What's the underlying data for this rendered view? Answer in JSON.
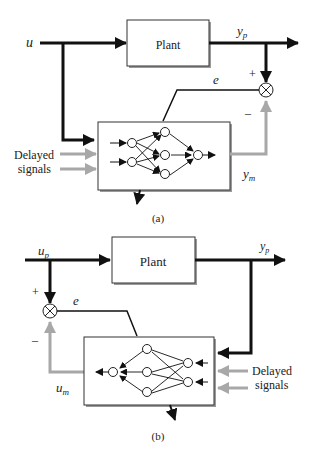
{
  "diagram_a": {
    "input_label": "u",
    "output_label": "y",
    "output_sub": "p",
    "plant_label": "Plant",
    "error_label": "e",
    "plus_sign": "+",
    "minus_sign": "–",
    "delayed_line1": "Delayed",
    "delayed_line2": "signals",
    "model_output_label": "y",
    "model_output_sub": "m",
    "caption": "(a)"
  },
  "diagram_b": {
    "input_label": "u",
    "input_sub": "p",
    "output_label": "y",
    "output_sub": "p",
    "plant_label": "Plant",
    "error_label": "e",
    "plus_sign": "+",
    "minus_sign": "–",
    "delayed_line1": "Delayed",
    "delayed_line2": "signals",
    "model_output_label": "u",
    "model_output_sub": "m",
    "caption": "(b)"
  },
  "colors": {
    "signal": "#111111",
    "delayed": "#a8a8a8",
    "box_shadow": "#9a9a9a"
  }
}
